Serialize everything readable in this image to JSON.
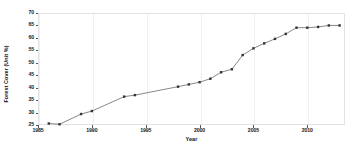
{
  "chart_data": {
    "type": "line",
    "title": "",
    "xlabel": "Year",
    "ylabel": "Forest Cover (Unit %)",
    "xlim": [
      1985,
      2013.5
    ],
    "ylim": [
      25,
      70
    ],
    "xticks": [
      1985,
      1990,
      1995,
      2000,
      2005,
      2010
    ],
    "yticks": [
      25,
      30,
      35,
      40,
      45,
      50,
      55,
      60,
      65,
      70
    ],
    "grid": true,
    "legend": null,
    "marker": "square",
    "line_color": "#555555",
    "marker_color": "#333333",
    "x": [
      1986,
      1987,
      1989,
      1990,
      1993,
      1994,
      1998,
      1999,
      2000,
      2001,
      2002,
      2003,
      2004,
      2005,
      2006,
      2007,
      2008,
      2009,
      2010,
      2011,
      2012,
      2013
    ],
    "values": [
      25.6,
      25.3,
      29.4,
      30.6,
      36.4,
      37.0,
      40.4,
      41.3,
      42.2,
      43.6,
      46.2,
      47.4,
      53.1,
      55.8,
      57.8,
      59.6,
      61.6,
      64.1,
      64.1,
      64.4,
      65.0,
      65.0
    ],
    "series": [
      {
        "name": "Forest Cover",
        "x": [
          1986,
          1987,
          1989,
          1990,
          1993,
          1994,
          1998,
          1999,
          2000,
          2001,
          2002,
          2003,
          2004,
          2005,
          2006,
          2007,
          2008,
          2009,
          2010,
          2011,
          2012,
          2013
        ],
        "values": [
          25.6,
          25.3,
          29.4,
          30.6,
          36.4,
          37.0,
          40.4,
          41.3,
          42.2,
          43.6,
          46.2,
          47.4,
          53.1,
          55.8,
          57.8,
          59.6,
          61.6,
          64.1,
          64.1,
          64.4,
          65.0,
          65.0
        ]
      }
    ]
  }
}
